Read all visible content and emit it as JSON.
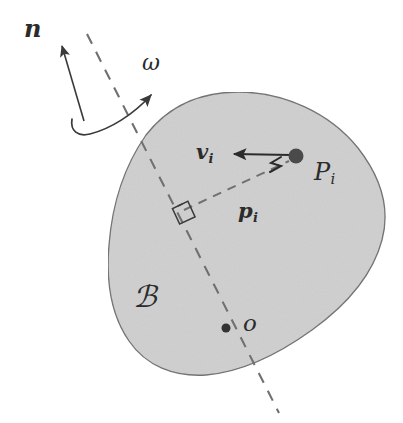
{
  "figure": {
    "type": "vector-diagram",
    "width": 403,
    "height": 423,
    "background_color": "#ffffff"
  },
  "body_region": {
    "name": "rigid-body",
    "label": "ℬ",
    "label_meaning": "script B, the rigid body",
    "fill_color": "#cfcfcf",
    "stroke_color": "#6e6e6e",
    "label_position": {
      "x": 133,
      "y": 282
    },
    "label_font_size": 30
  },
  "axis": {
    "name": "rotation-axis",
    "style": "dashed",
    "stroke_color": "#707070",
    "start": {
      "x": 87,
      "y": 34
    },
    "end": {
      "x": 279,
      "y": 413
    },
    "dash_pattern": "11 9"
  },
  "vectors": [
    {
      "name": "n",
      "label": "n",
      "label_meaning": "unit normal along rotation axis",
      "bold": true,
      "style": "straight-arrow",
      "tail": {
        "x": 84,
        "y": 121
      },
      "tip": {
        "x": 60,
        "y": 42
      },
      "label_position": {
        "x": 24,
        "y": 17
      },
      "label_font_size": 24,
      "stroke_color": "#3a3a3a"
    },
    {
      "name": "omega",
      "label": "ω",
      "label_meaning": "angular velocity",
      "bold": false,
      "style": "curved-arrow",
      "tail": {
        "x": 76,
        "y": 128
      },
      "tip": {
        "x": 156,
        "y": 91
      },
      "label_position": {
        "x": 142,
        "y": 52
      },
      "label_font_size": 22,
      "stroke_color": "#3a3a3a"
    },
    {
      "name": "v_i",
      "label": "v",
      "subscript": "i",
      "label_meaning": "velocity of material point P_i",
      "bold": true,
      "style": "straight-arrow",
      "tail": {
        "x": 292,
        "y": 156
      },
      "tip": {
        "x": 231,
        "y": 154
      },
      "label_position": {
        "x": 196,
        "y": 141
      },
      "label_font_size": 21,
      "stroke_color": "#2b2b2b"
    },
    {
      "name": "p_i",
      "label": "p",
      "subscript": "i",
      "label_meaning": "perpendicular position vector from axis to P_i",
      "bold": true,
      "style": "dashed-segment",
      "tail": {
        "x": 182,
        "y": 209
      },
      "tip": {
        "x": 292,
        "y": 159
      },
      "label_position": {
        "x": 238,
        "y": 200
      },
      "label_font_size": 21,
      "stroke_color": "#707070"
    }
  ],
  "points": [
    {
      "name": "P_i",
      "label": "P",
      "subscript": "i",
      "label_meaning": "material point on the body",
      "position": {
        "x": 296,
        "y": 156
      },
      "radius": 7.5,
      "color": "#4a4a4a",
      "label_position": {
        "x": 314,
        "y": 160
      },
      "label_font_size": 24
    },
    {
      "name": "o",
      "label": "o",
      "label_meaning": "reference point on the rotation axis",
      "position": {
        "x": 226,
        "y": 328
      },
      "radius": 4.5,
      "color": "#333333",
      "label_position": {
        "x": 243,
        "y": 312
      },
      "label_font_size": 23
    }
  ],
  "markers": [
    {
      "name": "right-angle-marker",
      "meaning": "p_i is perpendicular to the rotation axis",
      "position": {
        "x": 183,
        "y": 212
      },
      "size": 17,
      "stroke_color": "#3a3a3a"
    },
    {
      "name": "double-tick-marker",
      "meaning": "tick hatch near P_i on the velocity arrow",
      "position": {
        "x": 277,
        "y": 166
      },
      "stroke_color": "#2b2b2b"
    }
  ]
}
